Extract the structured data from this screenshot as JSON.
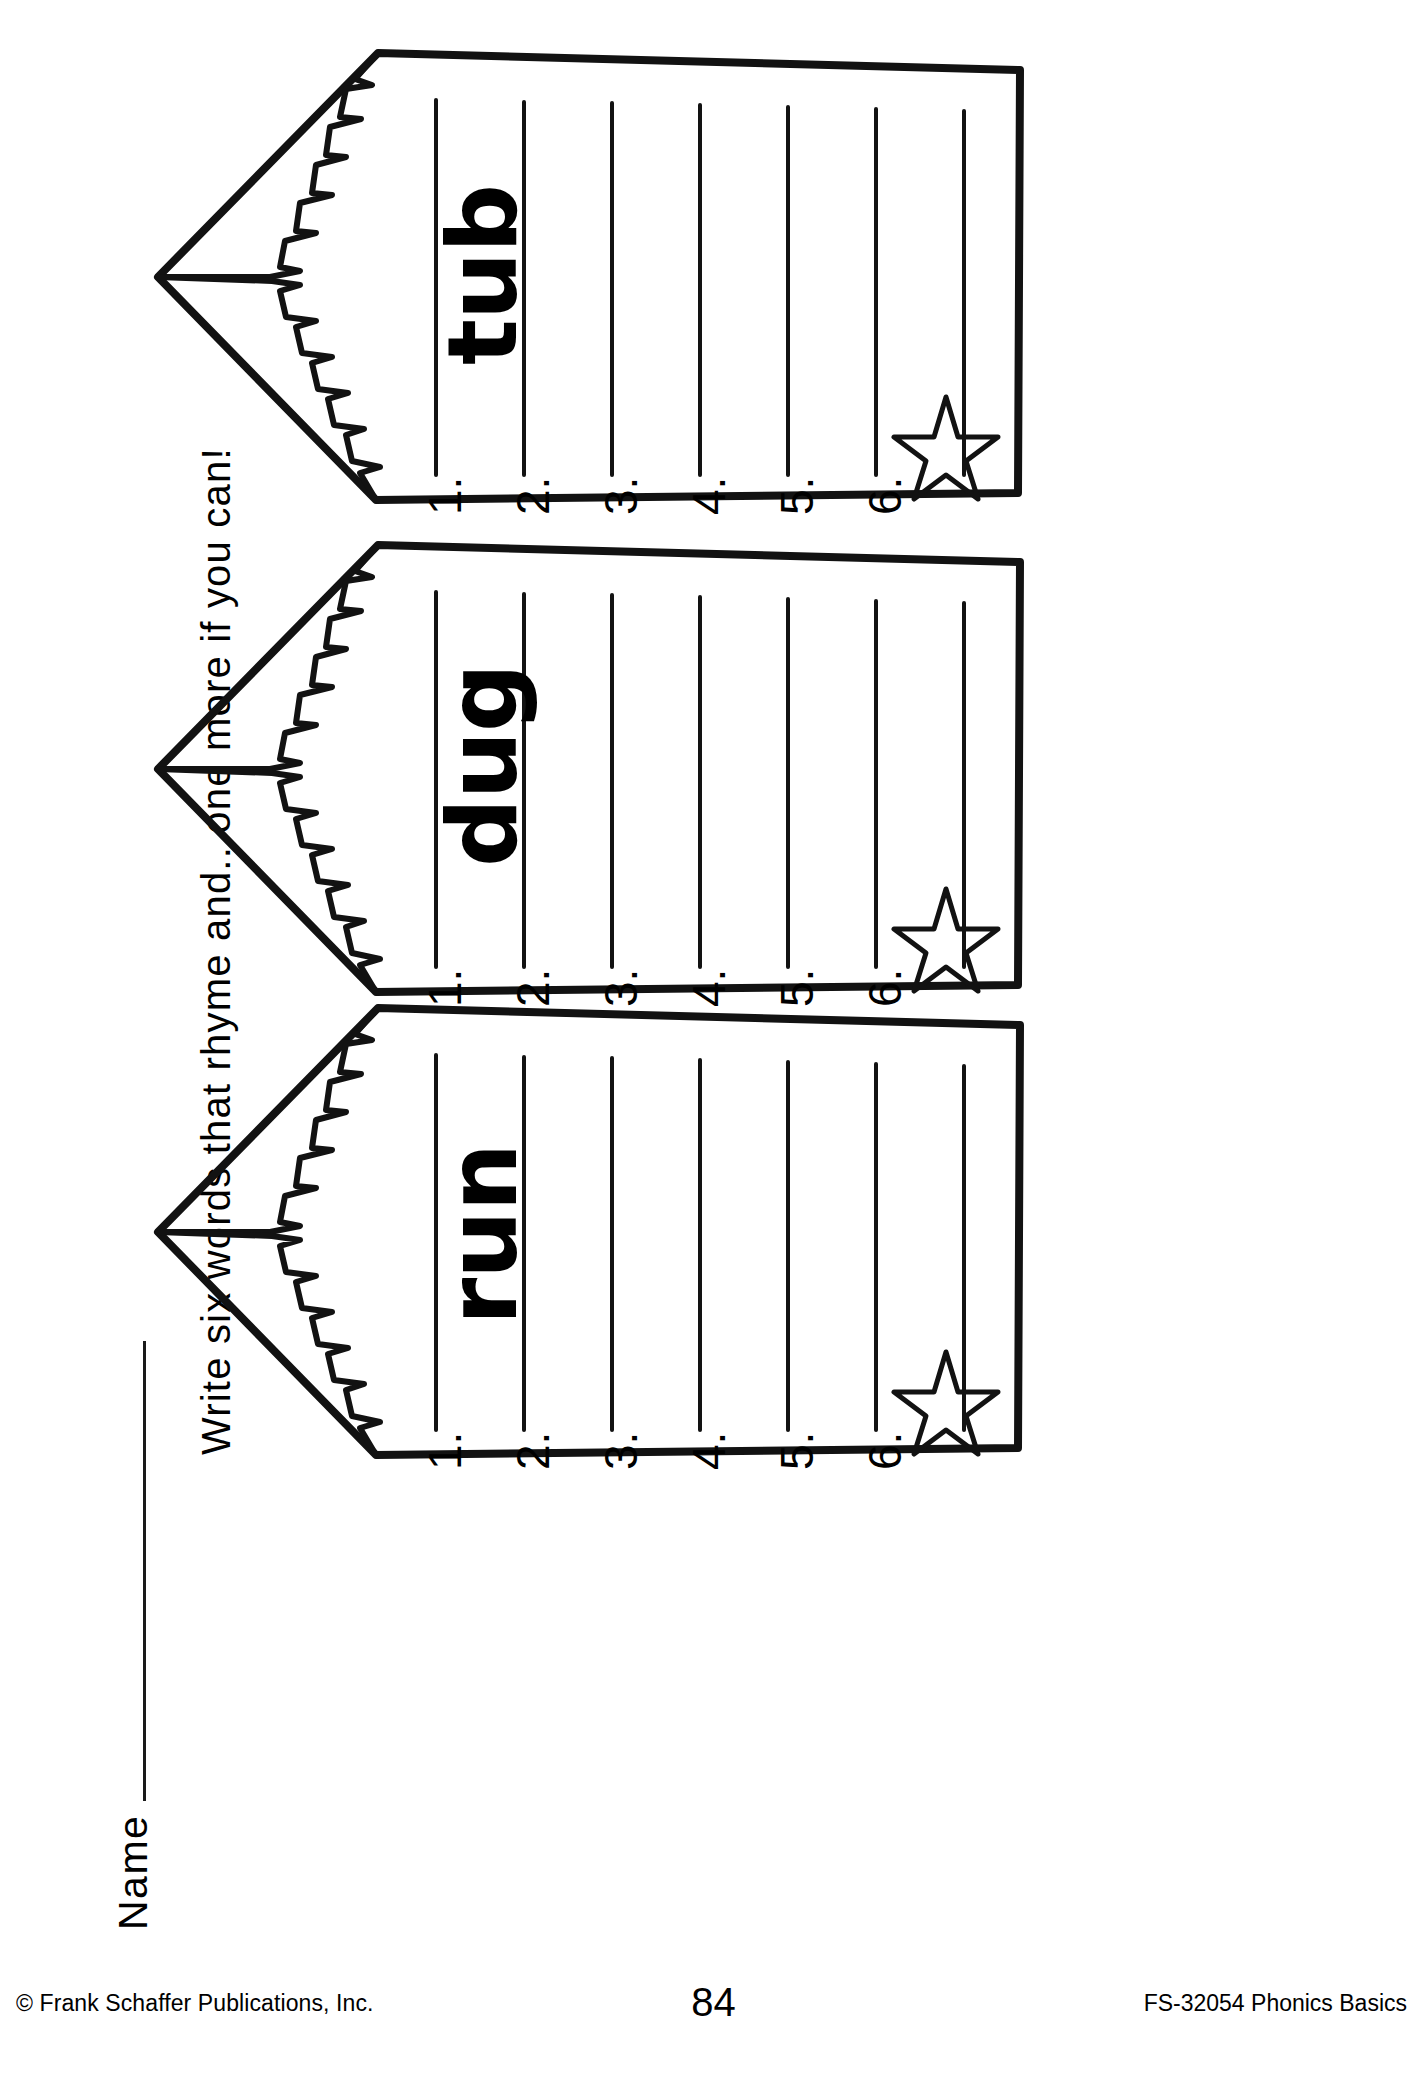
{
  "page": {
    "width": 1427,
    "height": 2077,
    "background": "#ffffff",
    "ink": "#000000"
  },
  "header": {
    "name_label": "Name",
    "name_rule": "",
    "instruction": "Write six words that rhyme and...one more if you can!"
  },
  "pennants": [
    {
      "word": "tub",
      "numbers": [
        "1.",
        "2.",
        "3.",
        "4.",
        "5.",
        "6."
      ],
      "bonus_icon": "star-icon"
    },
    {
      "word": "dug",
      "numbers": [
        "1.",
        "2.",
        "3.",
        "4.",
        "5.",
        "6."
      ],
      "bonus_icon": "star-icon"
    },
    {
      "word": "run",
      "numbers": [
        "1.",
        "2.",
        "3.",
        "4.",
        "5.",
        "6."
      ],
      "bonus_icon": "star-icon"
    }
  ],
  "footer": {
    "copyright": "© Frank Schaffer Publications, Inc.",
    "page_number": "84",
    "product_code": "FS-32054 Phonics Basics"
  }
}
